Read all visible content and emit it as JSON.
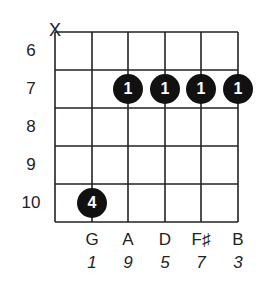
{
  "diagram": {
    "type": "guitar-chord-chart",
    "strings": 6,
    "fret_rows": [
      "6",
      "7",
      "8",
      "9",
      "10"
    ],
    "muted_string_marker": "X",
    "muted_string_index": 0,
    "dots": [
      {
        "string": 2,
        "fret": "7",
        "finger": "1"
      },
      {
        "string": 3,
        "fret": "7",
        "finger": "1"
      },
      {
        "string": 4,
        "fret": "7",
        "finger": "1"
      },
      {
        "string": 5,
        "fret": "7",
        "finger": "1"
      },
      {
        "string": 1,
        "fret": "10",
        "finger": "4"
      }
    ],
    "notes": [
      "G",
      "A",
      "D",
      "F♯",
      "B"
    ],
    "intervals": [
      "1",
      "9",
      "5",
      "7",
      "3"
    ]
  }
}
